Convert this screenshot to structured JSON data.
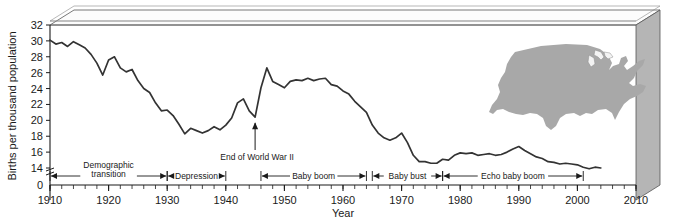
{
  "chart_data": {
    "type": "line",
    "title": "",
    "xlabel": "Year",
    "ylabel": "Births per thousand population",
    "xlim": [
      1910,
      2010
    ],
    "ylim": [
      13,
      32
    ],
    "y_axis_break": true,
    "y_zero_label": "0",
    "grid": false,
    "legend": "none",
    "x_tick_labels": [
      "1910",
      "1920",
      "1930",
      "1940",
      "1950",
      "1960",
      "1970",
      "1980",
      "1990",
      "2000",
      "2010"
    ],
    "x_minor_tick_interval": 2,
    "y_tick_labels": [
      "14",
      "16",
      "18",
      "20",
      "22",
      "24",
      "26",
      "28",
      "30",
      "32"
    ],
    "series_name": "Births per thousand population",
    "x": [
      1910,
      1911,
      1912,
      1913,
      1914,
      1915,
      1916,
      1917,
      1918,
      1919,
      1920,
      1921,
      1922,
      1923,
      1924,
      1925,
      1926,
      1927,
      1928,
      1929,
      1930,
      1931,
      1932,
      1933,
      1934,
      1935,
      1936,
      1937,
      1938,
      1939,
      1940,
      1941,
      1942,
      1943,
      1944,
      1945,
      1946,
      1947,
      1948,
      1949,
      1950,
      1951,
      1952,
      1953,
      1954,
      1955,
      1956,
      1957,
      1958,
      1959,
      1960,
      1961,
      1962,
      1963,
      1964,
      1965,
      1966,
      1967,
      1968,
      1969,
      1970,
      1971,
      1972,
      1973,
      1974,
      1975,
      1976,
      1977,
      1978,
      1979,
      1980,
      1981,
      1982,
      1983,
      1984,
      1985,
      1986,
      1987,
      1988,
      1989,
      1990,
      1991,
      1992,
      1993,
      1994,
      1995,
      1996,
      1997,
      1998,
      1999,
      2000,
      2001,
      2002,
      2003,
      2004
    ],
    "values": [
      30.1,
      29.6,
      29.8,
      29.3,
      29.9,
      29.5,
      29.1,
      28.3,
      27.2,
      25.7,
      27.6,
      28.0,
      26.6,
      26.1,
      26.4,
      25.0,
      24.0,
      23.5,
      22.2,
      21.2,
      21.3,
      20.6,
      19.5,
      18.3,
      19.0,
      18.7,
      18.4,
      18.7,
      19.2,
      18.8,
      19.4,
      20.3,
      22.2,
      22.7,
      21.2,
      20.4,
      24.1,
      26.6,
      24.9,
      24.5,
      24.1,
      24.9,
      25.1,
      25.0,
      25.3,
      25.0,
      25.2,
      25.3,
      24.5,
      24.3,
      23.7,
      23.3,
      22.4,
      21.7,
      21.0,
      19.4,
      18.4,
      17.8,
      17.5,
      17.8,
      18.4,
      17.2,
      15.6,
      14.8,
      14.8,
      14.6,
      14.6,
      15.1,
      15.0,
      15.6,
      15.9,
      15.8,
      15.9,
      15.6,
      15.7,
      15.8,
      15.6,
      15.7,
      16.0,
      16.4,
      16.7,
      16.2,
      15.8,
      15.4,
      15.2,
      14.8,
      14.7,
      14.5,
      14.6,
      14.5,
      14.4,
      14.1,
      13.9,
      14.1,
      14.0
    ],
    "annotations": [
      {
        "name": "end-of-wwii",
        "text": "End of World War II",
        "year": 1945
      },
      {
        "name": "us-map",
        "text": "United States map silhouette",
        "color": "#a8a8a8"
      }
    ],
    "period_brackets": [
      {
        "name": "demographic-transition",
        "label_line1": "Demographic",
        "label_line2": "transition",
        "start": 1910,
        "end": 1930
      },
      {
        "name": "depression",
        "label_line1": "Depression",
        "label_line2": "",
        "start": 1930,
        "end": 1940
      },
      {
        "name": "baby-boom",
        "label_line1": "Baby boom",
        "label_line2": "",
        "start": 1946,
        "end": 1964
      },
      {
        "name": "baby-bust",
        "label_line1": "Baby bust",
        "label_line2": "",
        "start": 1965,
        "end": 1977
      },
      {
        "name": "echo-baby-boom",
        "label_line1": "Echo baby boom",
        "label_line2": "",
        "start": 1977,
        "end": 2001
      }
    ],
    "colors": {
      "line": "#333333",
      "axis": "#1a1a1a",
      "map_fill": "#a8a8a8",
      "box_side": "#b5b5b5",
      "box_top": "#fdfdfd",
      "background": "#ffffff"
    }
  }
}
